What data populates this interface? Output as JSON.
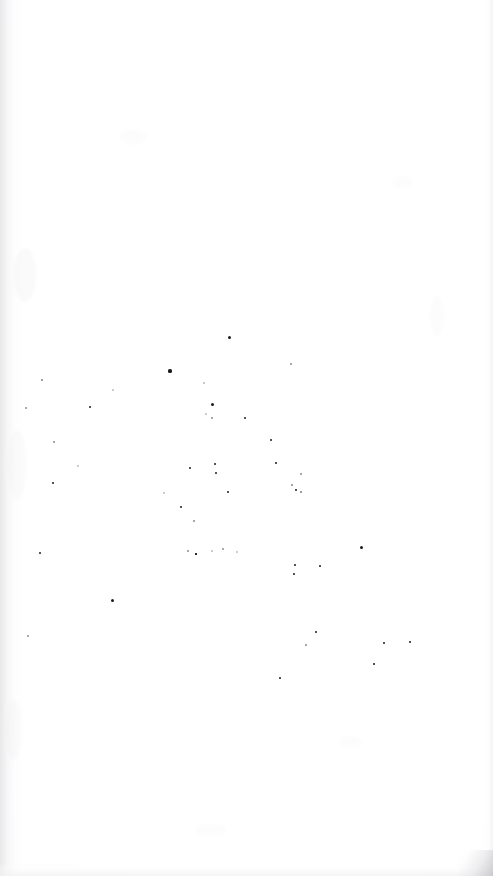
{
  "document": {
    "kind": "scanned-page",
    "page_label": "",
    "background_color": "#ffffff",
    "ink_color": "#1b1b1b",
    "edge_shadow_color": "#e4e4e6",
    "width_px": 493,
    "height_px": 876,
    "visible_text": "",
    "note": ""
  },
  "ghost_text": [
    {
      "text": "",
      "x": 36,
      "y": 858
    },
    {
      "text": "",
      "x": 262,
      "y": 860
    }
  ],
  "specks": [
    {
      "x": 229,
      "y": 337,
      "size": 3.0,
      "tone": ""
    },
    {
      "x": 170,
      "y": 371,
      "size": 3.2,
      "tone": ""
    },
    {
      "x": 291,
      "y": 364,
      "size": 2.0,
      "tone": "faint"
    },
    {
      "x": 42,
      "y": 380,
      "size": 1.6,
      "tone": "faint"
    },
    {
      "x": 113,
      "y": 390,
      "size": 1.4,
      "tone": "vfaint"
    },
    {
      "x": 26,
      "y": 408,
      "size": 2.2,
      "tone": "faint"
    },
    {
      "x": 90,
      "y": 407,
      "size": 2.8,
      "tone": ""
    },
    {
      "x": 212,
      "y": 404,
      "size": 3.0,
      "tone": ""
    },
    {
      "x": 204,
      "y": 383,
      "size": 1.5,
      "tone": "vfaint"
    },
    {
      "x": 212,
      "y": 418,
      "size": 2.0,
      "tone": "faint"
    },
    {
      "x": 245,
      "y": 418,
      "size": 2.4,
      "tone": ""
    },
    {
      "x": 54,
      "y": 442,
      "size": 2.0,
      "tone": "faint"
    },
    {
      "x": 271,
      "y": 440,
      "size": 2.6,
      "tone": ""
    },
    {
      "x": 78,
      "y": 466,
      "size": 1.4,
      "tone": "vfaint"
    },
    {
      "x": 190,
      "y": 468,
      "size": 2.6,
      "tone": ""
    },
    {
      "x": 215,
      "y": 464,
      "size": 2.4,
      "tone": ""
    },
    {
      "x": 216,
      "y": 473,
      "size": 2.4,
      "tone": ""
    },
    {
      "x": 276,
      "y": 463,
      "size": 2.2,
      "tone": ""
    },
    {
      "x": 301,
      "y": 474,
      "size": 1.8,
      "tone": "faint"
    },
    {
      "x": 53,
      "y": 483,
      "size": 2.8,
      "tone": ""
    },
    {
      "x": 228,
      "y": 492,
      "size": 2.6,
      "tone": ""
    },
    {
      "x": 292,
      "y": 485,
      "size": 1.8,
      "tone": "faint"
    },
    {
      "x": 296,
      "y": 490,
      "size": 2.2,
      "tone": ""
    },
    {
      "x": 301,
      "y": 492,
      "size": 1.6,
      "tone": "faint"
    },
    {
      "x": 181,
      "y": 507,
      "size": 2.6,
      "tone": ""
    },
    {
      "x": 194,
      "y": 521,
      "size": 2.0,
      "tone": "faint"
    },
    {
      "x": 40,
      "y": 553,
      "size": 2.6,
      "tone": ""
    },
    {
      "x": 188,
      "y": 551,
      "size": 2.0,
      "tone": "faint"
    },
    {
      "x": 196,
      "y": 554,
      "size": 2.4,
      "tone": "square"
    },
    {
      "x": 212,
      "y": 551,
      "size": 1.6,
      "tone": "vfaint"
    },
    {
      "x": 223,
      "y": 549,
      "size": 2.2,
      "tone": "faint"
    },
    {
      "x": 237,
      "y": 552,
      "size": 1.8,
      "tone": "vfaint"
    },
    {
      "x": 361,
      "y": 547,
      "size": 3.0,
      "tone": ""
    },
    {
      "x": 295,
      "y": 565,
      "size": 2.6,
      "tone": ""
    },
    {
      "x": 320,
      "y": 566,
      "size": 2.4,
      "tone": ""
    },
    {
      "x": 294,
      "y": 574,
      "size": 2.4,
      "tone": ""
    },
    {
      "x": 112,
      "y": 600,
      "size": 3.0,
      "tone": ""
    },
    {
      "x": 28,
      "y": 636,
      "size": 2.4,
      "tone": "faint"
    },
    {
      "x": 316,
      "y": 632,
      "size": 2.8,
      "tone": ""
    },
    {
      "x": 306,
      "y": 645,
      "size": 2.0,
      "tone": "faint"
    },
    {
      "x": 384,
      "y": 643,
      "size": 2.4,
      "tone": ""
    },
    {
      "x": 410,
      "y": 642,
      "size": 2.4,
      "tone": ""
    },
    {
      "x": 374,
      "y": 664,
      "size": 2.4,
      "tone": ""
    },
    {
      "x": 280,
      "y": 678,
      "size": 2.6,
      "tone": ""
    },
    {
      "x": 206,
      "y": 414,
      "size": 1.4,
      "tone": "vfaint"
    },
    {
      "x": 164,
      "y": 493,
      "size": 1.6,
      "tone": "vfaint"
    }
  ],
  "blobs": [
    {
      "x": 14,
      "y": 248,
      "w": 22,
      "h": 54,
      "opacity": 0.28
    },
    {
      "x": 8,
      "y": 430,
      "w": 18,
      "h": 70,
      "opacity": 0.22
    },
    {
      "x": 6,
      "y": 700,
      "w": 16,
      "h": 60,
      "opacity": 0.2
    },
    {
      "x": 120,
      "y": 130,
      "w": 26,
      "h": 14,
      "opacity": 0.16
    },
    {
      "x": 392,
      "y": 176,
      "w": 20,
      "h": 12,
      "opacity": 0.14
    },
    {
      "x": 338,
      "y": 736,
      "w": 24,
      "h": 12,
      "opacity": 0.14
    },
    {
      "x": 196,
      "y": 824,
      "w": 30,
      "h": 12,
      "opacity": 0.14
    },
    {
      "x": 430,
      "y": 296,
      "w": 14,
      "h": 40,
      "opacity": 0.16
    }
  ]
}
